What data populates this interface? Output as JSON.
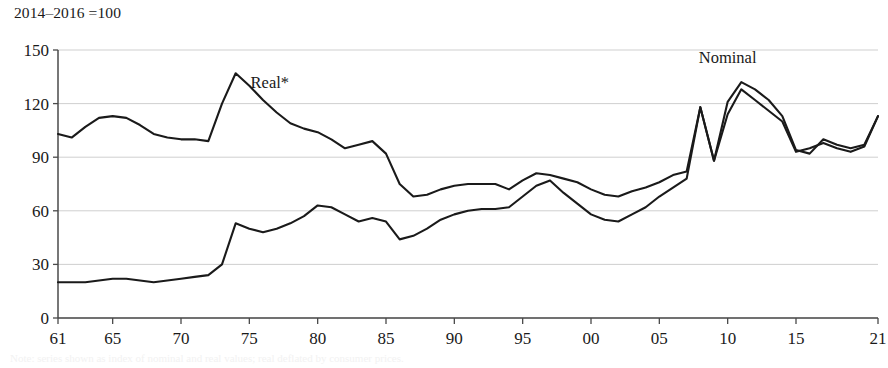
{
  "figure": {
    "index_note": "2014–2016 =100",
    "caption_partial": "Note: series shown as index of nominal and real values; real deflated by consumer prices."
  },
  "chart_data": {
    "type": "line",
    "title": "",
    "subtitle": "2014–2016 =100",
    "xlabel": "",
    "ylabel": "",
    "xlim": [
      1961,
      2021
    ],
    "ylim": [
      0,
      150
    ],
    "yticks": [
      0,
      30,
      60,
      90,
      120,
      150
    ],
    "ytick_labels": [
      "0",
      "30",
      "60",
      "90",
      "120",
      "150"
    ],
    "xticks": [
      1961,
      1965,
      1970,
      1975,
      1980,
      1985,
      1990,
      1995,
      2000,
      2005,
      2010,
      2015,
      2021
    ],
    "xtick_labels": [
      "61",
      "65",
      "70",
      "75",
      "80",
      "85",
      "90",
      "95",
      "00",
      "05",
      "10",
      "15",
      "21"
    ],
    "grid": true,
    "grid_axis": "y",
    "legend": "inline-annotations",
    "annotations": [
      {
        "text": "Real*",
        "x": 1976.5,
        "y": 129
      },
      {
        "text": "Nominal",
        "x": 2010.0,
        "y": 143
      }
    ],
    "x": [
      1961,
      1962,
      1963,
      1964,
      1965,
      1966,
      1967,
      1968,
      1969,
      1970,
      1971,
      1972,
      1973,
      1974,
      1975,
      1976,
      1977,
      1978,
      1979,
      1980,
      1981,
      1982,
      1983,
      1984,
      1985,
      1986,
      1987,
      1988,
      1989,
      1990,
      1991,
      1992,
      1993,
      1994,
      1995,
      1996,
      1997,
      1998,
      1999,
      2000,
      2001,
      2002,
      2003,
      2004,
      2005,
      2006,
      2007,
      2008,
      2009,
      2010,
      2011,
      2012,
      2013,
      2014,
      2015,
      2016,
      2017,
      2018,
      2019,
      2020,
      2021
    ],
    "series": [
      {
        "name": "Real*",
        "values": [
          103,
          101,
          107,
          112,
          113,
          112,
          108,
          103,
          101,
          100,
          100,
          99,
          120,
          137,
          130,
          122,
          115,
          109,
          106,
          104,
          100,
          95,
          97,
          99,
          92,
          75,
          68,
          69,
          72,
          74,
          75,
          75,
          75,
          72,
          77,
          81,
          80,
          78,
          76,
          72,
          69,
          68,
          71,
          73,
          76,
          80,
          82,
          118,
          88,
          121,
          132,
          128,
          122,
          113,
          94,
          92,
          100,
          97,
          95,
          97,
          113
        ]
      },
      {
        "name": "Nominal",
        "values": [
          20,
          20,
          20,
          21,
          22,
          22,
          21,
          20,
          21,
          22,
          23,
          24,
          30,
          53,
          50,
          48,
          50,
          53,
          57,
          63,
          62,
          58,
          54,
          56,
          54,
          44,
          46,
          50,
          55,
          58,
          60,
          61,
          61,
          62,
          68,
          74,
          77,
          70,
          64,
          58,
          55,
          54,
          58,
          62,
          68,
          73,
          78,
          118,
          88,
          114,
          128,
          122,
          116,
          110,
          93,
          95,
          98,
          95,
          93,
          96,
          113
        ]
      }
    ]
  }
}
